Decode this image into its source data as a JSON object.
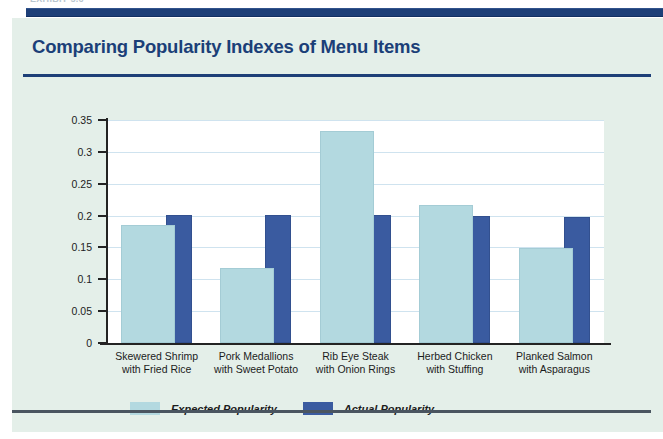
{
  "page": {
    "running_head": "EXHIBIT 5.6",
    "background_color": "#e4efe9",
    "rule_color": "#1d3f78"
  },
  "panel": {
    "title": "Comparing Popularity Indexes of Menu Items"
  },
  "legend": {
    "position": "bottom-left",
    "items": [
      {
        "label": "Expected Popularity",
        "color": "#b3d9e0",
        "swatch_name": "legend-swatch-expected"
      },
      {
        "label": "Actual Popularity",
        "color": "#3a5ba0",
        "swatch_name": "legend-swatch-actual"
      }
    ]
  },
  "chart_data": {
    "type": "bar",
    "title": "Comparing Popularity Indexes of Menu Items",
    "xlabel": "",
    "ylabel": "",
    "ylim": [
      0,
      0.35
    ],
    "yticks": [
      "0",
      "0.05",
      "0.1",
      "0.15",
      "0.2",
      "0.25",
      "0.3",
      "0.35"
    ],
    "ytick_values": [
      0,
      0.05,
      0.1,
      0.15,
      0.2,
      0.25,
      0.3,
      0.35
    ],
    "grid": true,
    "legend_position": "bottom-left",
    "bar_style": "overlapped",
    "categories": [
      "Skewered Shrimp\nwith Fried Rice",
      "Pork Medallions\nwith Sweet Potato",
      "Rib Eye Steak\nwith Onion Rings",
      "Herbed Chicken\nwith Stuffing",
      "Planked Salmon\nwith Asparagus"
    ],
    "category_lines": [
      [
        "Skewered Shrimp",
        "with Fried Rice"
      ],
      [
        "Pork Medallions",
        "with Sweet Potato"
      ],
      [
        "Rib Eye Steak",
        "with Onion Rings"
      ],
      [
        "Herbed Chicken",
        "with Stuffing"
      ],
      [
        "Planked Salmon",
        "with Asparagus"
      ]
    ],
    "series": [
      {
        "name": "Expected Popularity",
        "color": "#b3d9e0",
        "values": [
          0.182,
          0.115,
          0.33,
          0.213,
          0.146
        ]
      },
      {
        "name": "Actual Popularity",
        "color": "#3a5ba0",
        "values": [
          0.198,
          0.198,
          0.198,
          0.196,
          0.195
        ]
      }
    ]
  }
}
